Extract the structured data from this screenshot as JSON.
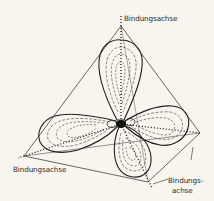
{
  "figure": {
    "labels": {
      "top": "Bindungsachse",
      "left": "Bindungsachse",
      "bottom_right_line1": "Bindungs-",
      "bottom_right_line2": "achse"
    },
    "colors": {
      "background": "#f7f5ee",
      "ink": "#1e1e1e",
      "nucleus": "#111111"
    }
  }
}
